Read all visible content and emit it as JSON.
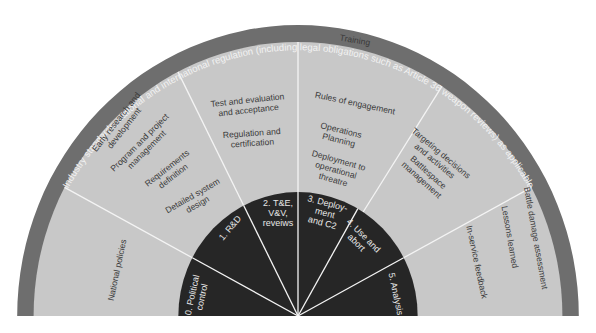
{
  "diagram": {
    "title_ring": "Industry standards, national and international regulation (including legal obligations such as Article 36 weapon reviews) as applicable",
    "colors": {
      "outer_band": "#6e6e6e",
      "segment_fill": "#c8c8c8",
      "inner_fill": "#262626",
      "spoke": "#f4f4f4",
      "segment_text": "#3a3a3a",
      "inner_text": "#e6e6e6"
    },
    "stages": [
      {
        "label_lines": [
          "0. Political",
          "control"
        ]
      },
      {
        "label_lines": [
          "1. R&D"
        ]
      },
      {
        "label_lines": [
          "2. T&E,",
          "V&V,",
          "reveiws"
        ]
      },
      {
        "label_lines": [
          "3. Deploy-",
          "ment",
          "and C2"
        ]
      },
      {
        "label_lines": [
          "4. Use and",
          "abort"
        ]
      },
      {
        "label_lines": [
          "5. Analysis"
        ]
      }
    ],
    "activities": [
      {
        "stage": 0,
        "items": [
          [
            "National policies"
          ]
        ]
      },
      {
        "stage": 1,
        "items": [
          [
            "Early research and",
            "development"
          ],
          [
            "Program and project",
            "management"
          ],
          [
            "Requirements",
            "definition"
          ],
          [
            "Detailed system",
            "design"
          ]
        ]
      },
      {
        "stage": 2,
        "items": [
          [
            "Test and evaluation",
            "and acceptance"
          ],
          [
            "Regulation and",
            "certification"
          ]
        ]
      },
      {
        "stage": 3,
        "items": [
          [
            "Training"
          ],
          [
            "Rules of engagement"
          ],
          [
            "Operations",
            "Planning"
          ],
          [
            "Deployment to",
            "operational",
            "threatre"
          ]
        ]
      },
      {
        "stage": 4,
        "items": [
          [
            "Targeting decisions",
            "and activities"
          ],
          [
            "Battlespace",
            "management"
          ]
        ]
      },
      {
        "stage": 5,
        "items": [
          [
            "Battle damage assessment"
          ],
          [
            "Lessons learned"
          ],
          [
            "In-service feedback"
          ]
        ]
      }
    ]
  }
}
